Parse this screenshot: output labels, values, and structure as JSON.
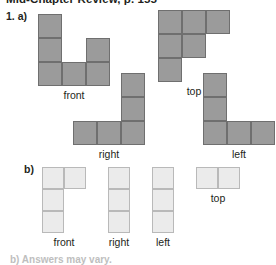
{
  "page": {
    "header_clipped": "Mid-Chapter Review, p. 155",
    "footer_clipped": "b) Answers may vary.",
    "background_color": "#ffffff"
  },
  "colors": {
    "cell_dark_fill": "#9b9b9b",
    "cell_dark_border": "#6f6f6f",
    "cell_light_fill": "#ebebeb",
    "cell_light_border": "#b9b9b9",
    "text": "#231f20"
  },
  "question": {
    "number_label": "1.",
    "parts": [
      {
        "id": "a",
        "label": "a)",
        "style": "dark",
        "cell_size": 24,
        "views": [
          {
            "name": "front",
            "label": "front",
            "x": 38,
            "y": 14,
            "cols": 3,
            "rows": 3,
            "cells": [
              [
                0,
                0
              ],
              [
                0,
                1
              ],
              [
                0,
                2
              ],
              [
                1,
                2
              ],
              [
                2,
                1
              ],
              [
                2,
                2
              ]
            ]
          },
          {
            "name": "top",
            "label": "top",
            "x": 158,
            "y": 10,
            "cols": 3,
            "rows": 3,
            "cells": [
              [
                0,
                0
              ],
              [
                1,
                0
              ],
              [
                2,
                0
              ],
              [
                0,
                1
              ],
              [
                1,
                1
              ],
              [
                0,
                2
              ]
            ]
          },
          {
            "name": "right",
            "label": "right",
            "x": 73,
            "y": 73,
            "cols": 3,
            "rows": 3,
            "cells": [
              [
                2,
                0
              ],
              [
                2,
                1
              ],
              [
                0,
                2
              ],
              [
                1,
                2
              ],
              [
                2,
                2
              ]
            ]
          },
          {
            "name": "left",
            "label": "left",
            "x": 203,
            "y": 73,
            "cols": 3,
            "rows": 3,
            "cells": [
              [
                0,
                0
              ],
              [
                0,
                1
              ],
              [
                0,
                2
              ],
              [
                1,
                2
              ],
              [
                2,
                2
              ]
            ]
          }
        ]
      },
      {
        "id": "b",
        "label": "b)",
        "style": "light",
        "cell_size": 22,
        "views": [
          {
            "name": "front",
            "label": "front",
            "x": 42,
            "y": 167,
            "cols": 2,
            "rows": 3,
            "cells": [
              [
                0,
                0
              ],
              [
                1,
                0
              ],
              [
                0,
                1
              ],
              [
                0,
                2
              ]
            ]
          },
          {
            "name": "right",
            "label": "right",
            "x": 108,
            "y": 167,
            "cols": 1,
            "rows": 3,
            "cells": [
              [
                0,
                0
              ],
              [
                0,
                1
              ],
              [
                0,
                2
              ]
            ]
          },
          {
            "name": "left",
            "label": "left",
            "x": 152,
            "y": 167,
            "cols": 1,
            "rows": 3,
            "cells": [
              [
                0,
                0
              ],
              [
                0,
                1
              ],
              [
                0,
                2
              ]
            ]
          },
          {
            "name": "top",
            "label": "top",
            "x": 196,
            "y": 167,
            "cols": 2,
            "rows": 1,
            "cells": [
              [
                0,
                0
              ],
              [
                1,
                0
              ]
            ]
          }
        ]
      }
    ]
  }
}
